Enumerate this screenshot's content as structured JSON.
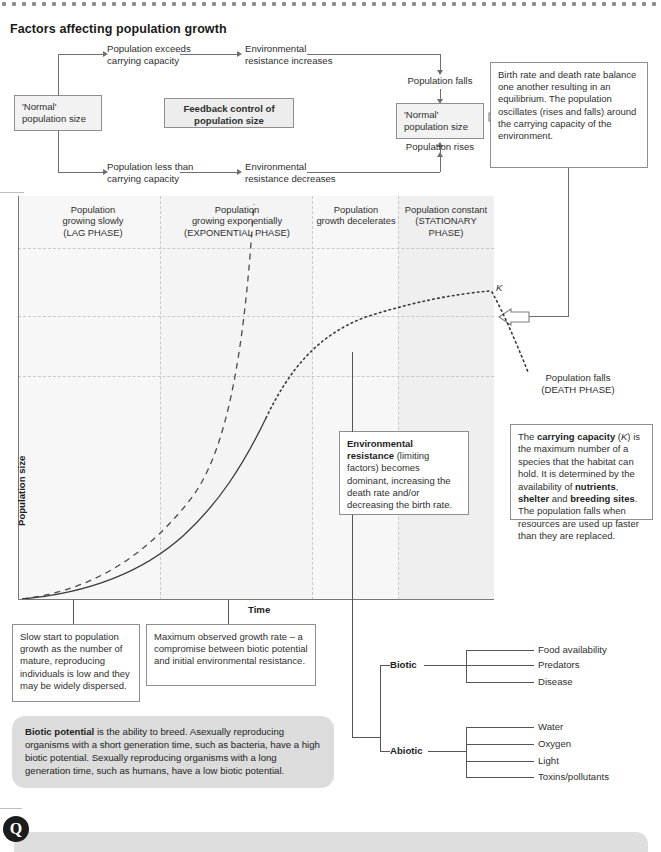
{
  "page": {
    "title": "Factors affecting population growth"
  },
  "flowchart": {
    "normal_left": "'Normal'\npopulation size",
    "branch_top": "Population exceeds\ncarrying capacity",
    "branch_top_next": "Environmental\nresistance increases",
    "population_falls": "Population falls",
    "feedback_box": "Feedback control\nof population size",
    "normal_right": "'Normal'\npopulation size",
    "population_rises": "Population rises",
    "branch_bottom": "Population less than\ncarrying capacity",
    "branch_bottom_next": "Environmental\nresistance decreases",
    "equilibrium_note": "Birth rate and death rate balance one another resulting in an equilibrium. The population oscillates (rises and falls) around the carrying capacity of the environment."
  },
  "graph": {
    "ylabel": "Population size",
    "xlabel": "Time",
    "k_label": "K",
    "phases": [
      {
        "label": "Population\ngrowing slowly\n(LAG PHASE)"
      },
      {
        "label": "Population\ngrowing exponentially\n(EXPONENTIAL PHASE)"
      },
      {
        "label": "Population\ngrowth decelerates"
      },
      {
        "label": "Population constant\n(STATIONARY\nPHASE)"
      }
    ],
    "death_phase_label": "Population falls\n(DEATH PHASE)"
  },
  "chart_data": {
    "type": "line",
    "xlabel": "Time",
    "ylabel": "Population size",
    "xlim": [
      0,
      100
    ],
    "ylim": [
      0,
      100
    ],
    "grid": true,
    "legend": "none",
    "annotations": [
      "K"
    ],
    "phase_boundaries": [
      0,
      30,
      62,
      80,
      100
    ],
    "series": [
      {
        "name": "Exponential growth (biotic potential)",
        "style": "dashed",
        "x": [
          0,
          8,
          16,
          24,
          32,
          40,
          46,
          51,
          54,
          56
        ],
        "y": [
          1,
          3,
          6,
          11,
          19,
          33,
          50,
          72,
          90,
          100
        ]
      },
      {
        "name": "Actual (sigmoid) population growth",
        "style": "solid-then-dotted",
        "x": [
          0,
          8,
          16,
          24,
          32,
          40,
          48,
          56,
          62,
          68,
          74,
          80,
          88,
          96,
          100
        ],
        "y": [
          1,
          2,
          4,
          7,
          12,
          20,
          32,
          48,
          60,
          70,
          77,
          82,
          85,
          87,
          88
        ]
      },
      {
        "name": "Death phase",
        "style": "dotted",
        "x": [
          100,
          104,
          108,
          112
        ],
        "y": [
          88,
          78,
          66,
          54
        ]
      }
    ]
  },
  "annotations": {
    "environmental_resistance": {
      "bold": "Environmental resistance",
      "rest": " (limiting factors) becomes dominant, increasing the death rate and/or decreasing the birth rate."
    },
    "carrying_capacity": {
      "line1_a": "The ",
      "line1_b": "carrying capacity",
      "line1_c": " (",
      "line1_k": "K",
      "line1_d": ") is the maximum number of a species that the habitat can hold. It is determined by the availability of ",
      "b_nutrients": "nutrients",
      "mid1": ", ",
      "b_shelter": "shelter",
      "mid2": " and ",
      "b_breeding": "breeding sites",
      "tail": ". The population falls when resources are used up faster than they are replaced."
    },
    "lag_note": "Slow start to population growth as the number of mature, reproducing individuals is low and they may be widely dispersed.",
    "max_growth_note": "Maximum observed growth rate – a compromise between biotic potential and initial environmental resistance.",
    "biotic_potential": {
      "bold": "Biotic potential",
      "rest": " is the ability to breed. Asexually reproducing organisms with a short generation time, such as bacteria, have a high biotic potential. Sexually reproducing organisms with a long generation time, such as humans, have a low biotic potential."
    }
  },
  "factor_tree": {
    "biotic_label": "Biotic",
    "biotic_items": [
      "Food availability",
      "Predators",
      "Disease"
    ],
    "abiotic_label": "Abiotic",
    "abiotic_items": [
      "Water",
      "Oxygen",
      "Light",
      "Toxins/pollutants"
    ]
  },
  "questions": {
    "badge": "Q"
  },
  "colors": {
    "ink": "#2f2f2f",
    "box_fill": "#f2f2f2",
    "band_fill": "#f6f6f6",
    "band_fill_alt": "#efefef",
    "line": "#6f6f6f",
    "panel": "#dcdcdc"
  }
}
